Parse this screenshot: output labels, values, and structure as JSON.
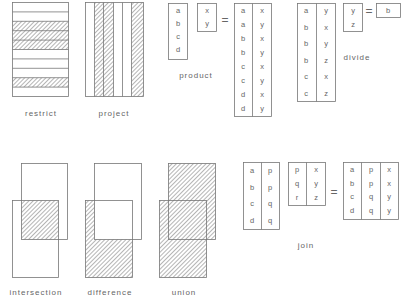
{
  "colors": {
    "stroke": "#777777",
    "hatch": "#777777",
    "text": "#666666",
    "background": "#ffffff"
  },
  "operations": {
    "restrict": {
      "label": "restrict",
      "rows": 10,
      "hatched_rows": [
        2,
        3,
        4,
        8
      ]
    },
    "project": {
      "label": "project",
      "columns": [
        "blank",
        "hatched",
        "hatched",
        "blank",
        "blank",
        "hatched"
      ]
    },
    "product": {
      "label": "product",
      "left": [
        "a",
        "b",
        "c",
        "d"
      ],
      "right": [
        "x",
        "y"
      ],
      "equals": "=",
      "result": [
        [
          "a",
          "x"
        ],
        [
          "a",
          "y"
        ],
        [
          "b",
          "x"
        ],
        [
          "b",
          "y"
        ],
        [
          "c",
          "x"
        ],
        [
          "c",
          "y"
        ],
        [
          "d",
          "x"
        ],
        [
          "d",
          "y"
        ]
      ]
    },
    "divide": {
      "label": "divide",
      "dividend": [
        [
          "a",
          "y"
        ],
        [
          "b",
          "x"
        ],
        [
          "b",
          "y"
        ],
        [
          "b",
          "z"
        ],
        [
          "c",
          "x"
        ],
        [
          "c",
          "z"
        ]
      ],
      "divisor": [
        "y",
        "z"
      ],
      "equals": "=",
      "result": [
        "b"
      ]
    },
    "intersection": {
      "label": "intersection"
    },
    "difference": {
      "label": "difference"
    },
    "union": {
      "label": "union"
    },
    "join": {
      "label": "join",
      "left": [
        [
          "a",
          "p"
        ],
        [
          "b",
          "p"
        ],
        [
          "c",
          "q"
        ],
        [
          "d",
          "q"
        ]
      ],
      "right": [
        [
          "p",
          "x"
        ],
        [
          "q",
          "y"
        ],
        [
          "r",
          "z"
        ]
      ],
      "equals": "=",
      "result": [
        [
          "a",
          "p",
          "x"
        ],
        [
          "b",
          "p",
          "x"
        ],
        [
          "c",
          "q",
          "y"
        ],
        [
          "d",
          "q",
          "y"
        ]
      ]
    }
  }
}
